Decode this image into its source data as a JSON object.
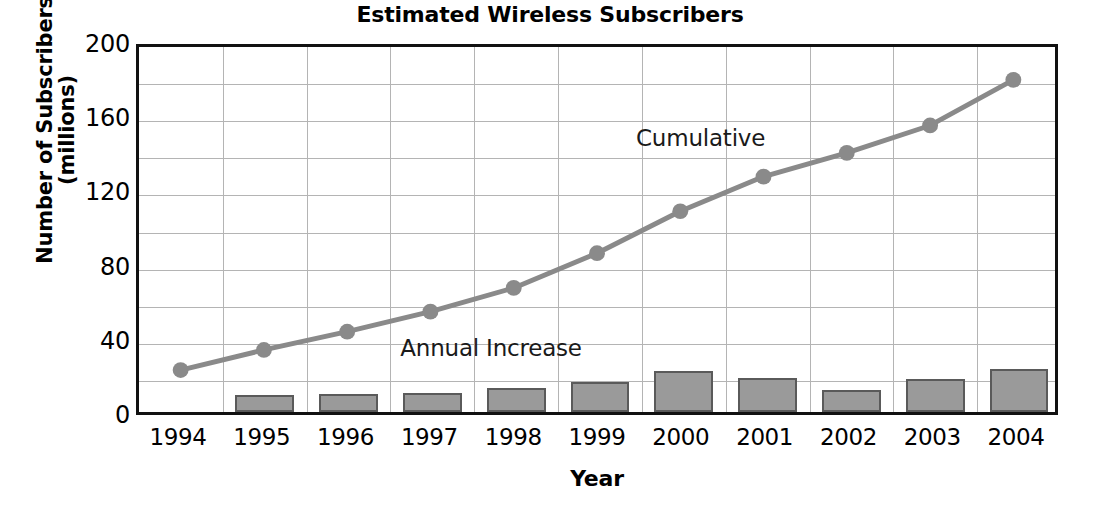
{
  "chart_data": {
    "type": "line",
    "title": "Estimated Wireless Subscribers",
    "xlabel": "Year",
    "ylabel": "Number of Subscribers\n(millions)",
    "categories": [
      "1994",
      "1995",
      "1996",
      "1997",
      "1998",
      "1999",
      "2000",
      "2001",
      "2002",
      "2003",
      "2004"
    ],
    "ylim": [
      0,
      200
    ],
    "ytick_labels": [
      "0",
      "40",
      "80",
      "120",
      "160",
      "200"
    ],
    "ytick_values": [
      0,
      40,
      80,
      120,
      160,
      200
    ],
    "yticks_minor": [
      20,
      60,
      100,
      140,
      180
    ],
    "grid": true,
    "grid_color": "#b4b4b4",
    "legend_position": "in-plot annotations",
    "series": [
      {
        "name": "Cumulative",
        "type": "line",
        "color": "#8a8a8a",
        "marker": "circle",
        "values": [
          23,
          34,
          44,
          55,
          68,
          87,
          110,
          129,
          142,
          157,
          182
        ]
      },
      {
        "name": "Annual Increase",
        "type": "bar",
        "color": "#9a9a9a",
        "edge_color": "#5a5a5a",
        "values": [
          0,
          9,
          9.5,
          10.5,
          13,
          16,
          22,
          18.5,
          12,
          18,
          23
        ]
      }
    ],
    "annotations": [
      {
        "text": "Cumulative",
        "x": 2000.2,
        "y": 151
      },
      {
        "text": "Annual Increase",
        "x": 1997.7,
        "y": 38
      }
    ]
  }
}
